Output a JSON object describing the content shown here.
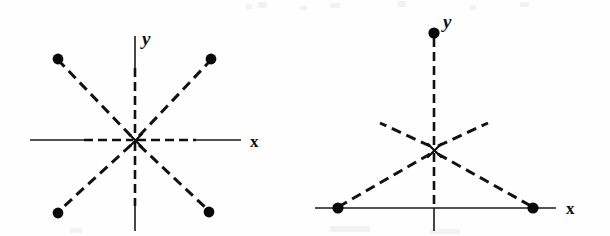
{
  "page": {
    "background_color": "#fefefe",
    "ink_color": "#111111",
    "width": 610,
    "height": 236
  },
  "figures": [
    {
      "id": "left-figure",
      "name": "four-point-symmetry-diagram",
      "axes": {
        "x_label": "x",
        "y_label": "y",
        "x_label_pos": {
          "x": 250,
          "y": 148
        },
        "y_label_pos": {
          "x": 142,
          "y": 45
        },
        "x_axis": {
          "x1": 30,
          "y1": 140,
          "x2": 241,
          "y2": 140
        },
        "y_axis": {
          "x1": 135,
          "y1": 36,
          "x2": 135,
          "y2": 231
        },
        "x_axis_style": "dashed-and-solid",
        "y_axis_style": "dashed-and-solid",
        "origin": {
          "x": 135,
          "y": 140
        }
      },
      "origin_marker": "x-cross",
      "rays": [
        {
          "name": "ray-upper-left",
          "to": {
            "x": 58,
            "y": 59
          }
        },
        {
          "name": "ray-upper-right",
          "to": {
            "x": 211,
            "y": 59
          }
        },
        {
          "name": "ray-lower-left",
          "to": {
            "x": 58,
            "y": 213
          }
        },
        {
          "name": "ray-lower-right",
          "to": {
            "x": 209,
            "y": 212
          }
        }
      ],
      "points": [
        {
          "name": "point-upper-left",
          "x": 58,
          "y": 59,
          "r": 5.4
        },
        {
          "name": "point-upper-right",
          "x": 211,
          "y": 59,
          "r": 5.4
        },
        {
          "name": "point-lower-left",
          "x": 58,
          "y": 213,
          "r": 5.4
        },
        {
          "name": "point-lower-right",
          "x": 209,
          "y": 212,
          "r": 5.4
        }
      ]
    },
    {
      "id": "right-figure",
      "name": "three-point-triangle-diagram",
      "axes": {
        "x_label": "x",
        "y_label": "y",
        "x_label_pos": {
          "x": 566,
          "y": 212
        },
        "y_label_pos": {
          "x": 443,
          "y": 28
        },
        "x_axis": {
          "x1": 315,
          "y1": 208,
          "x2": 556,
          "y2": 208
        },
        "y_axis": {
          "x1": 434,
          "y1": 33,
          "x2": 434,
          "y2": 231
        },
        "x_axis_style": "solid",
        "y_axis_style": "dashed-upper-solid-lower",
        "origin": {
          "x": 434,
          "y": 150
        }
      },
      "origin_marker": "x-cross",
      "rays": [
        {
          "name": "ray-up-vertical",
          "to": {
            "x": 434,
            "y": 33
          }
        },
        {
          "name": "ray-down-left-to-point",
          "to": {
            "x": 338,
            "y": 208
          }
        },
        {
          "name": "ray-down-right-to-point",
          "to": {
            "x": 533,
            "y": 208
          }
        },
        {
          "name": "ray-up-left-short",
          "to": {
            "x": 380,
            "y": 123
          }
        },
        {
          "name": "ray-up-right-short",
          "to": {
            "x": 488,
            "y": 123
          }
        }
      ],
      "points": [
        {
          "name": "point-top-on-y-axis",
          "x": 434,
          "y": 33,
          "r": 5.6
        },
        {
          "name": "point-left-on-x-axis",
          "x": 338,
          "y": 208,
          "r": 5.6
        },
        {
          "name": "point-right-on-x-axis",
          "x": 533,
          "y": 208,
          "r": 5.6
        }
      ]
    }
  ]
}
